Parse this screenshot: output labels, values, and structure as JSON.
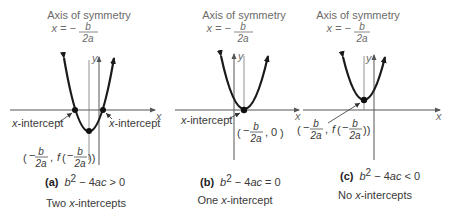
{
  "panels": [
    {
      "id": "a",
      "axis_title": "Axis of symmetry",
      "axis_eq_left": "x = −",
      "axis_eq_num": "b",
      "axis_eq_den": "2a",
      "y_label": "y",
      "x_label": "x",
      "intercept_left_label": "x-intercept",
      "intercept_right_label": "x-intercept",
      "vertex_label": "(− b/2a , f(− b/2a))",
      "caption_letter": "(a)",
      "caption_condition": "b² − 4ac > 0",
      "caption_text": "Two x-intercepts"
    },
    {
      "id": "b",
      "axis_title": "Axis of symmetry",
      "axis_eq_left": "x = −",
      "axis_eq_num": "b",
      "axis_eq_den": "2a",
      "y_label": "y",
      "x_label": "x",
      "intercept_label": "x-intercept",
      "vertex_label": "(− b/2a , 0)",
      "caption_letter": "(b)",
      "caption_condition": "b² − 4ac = 0",
      "caption_text": "One x-intercept"
    },
    {
      "id": "c",
      "axis_title": "Axis of symmetry",
      "axis_eq_left": "x = −",
      "axis_eq_num": "b",
      "axis_eq_den": "2a",
      "y_label": "y",
      "x_label": "x",
      "vertex_label": "(− b/2a , f(− b/2a))",
      "caption_letter": "(c)",
      "caption_condition": "b² − 4ac < 0",
      "caption_text": "No x-intercepts"
    }
  ],
  "colors": {
    "curve": "#1a1a1a",
    "axis": "#555555",
    "text": "#6b6b6b",
    "caption": "#333333"
  }
}
